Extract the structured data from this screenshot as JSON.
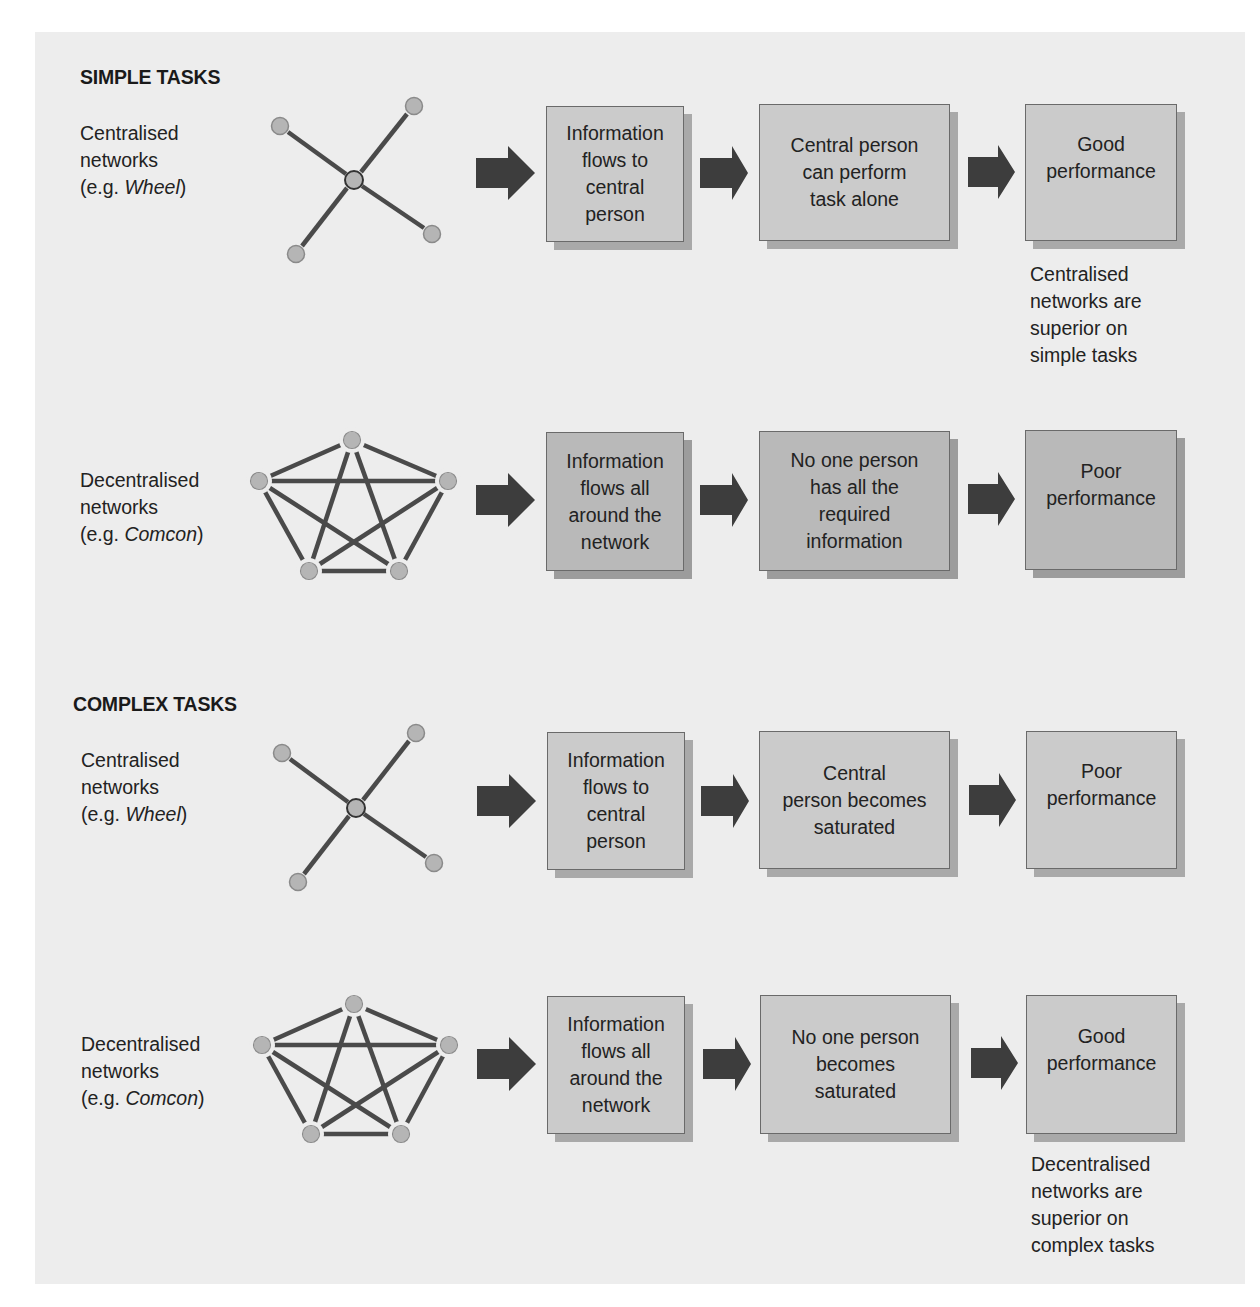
{
  "sections": [
    {
      "heading": "SIMPLE TASKS",
      "rows": [
        {
          "network_label": {
            "line1": "Centralised",
            "line2": "networks",
            "prefix": "(e.g. ",
            "example": "Wheel",
            "suffix": ")"
          },
          "network_type": "wheel",
          "steps": [
            "Information\nflows to\ncentral\nperson",
            "Central person\ncan perform\ntask alone",
            "Good\nperformance"
          ],
          "note": "Centralised\nnetworks are\nsuperior on\nsimple tasks"
        },
        {
          "network_label": {
            "line1": "Decentralised",
            "line2": "networks",
            "prefix": "(e.g. ",
            "example": "Comcon",
            "suffix": ")"
          },
          "network_type": "comcon",
          "steps": [
            "Information\nflows all\naround the\nnetwork",
            "No one person\nhas all the\nrequired\ninformation",
            "Poor\nperformance"
          ]
        }
      ]
    },
    {
      "heading": "COMPLEX TASKS",
      "rows": [
        {
          "network_label": {
            "line1": "Centralised",
            "line2": "networks",
            "prefix": "(e.g. ",
            "example": "Wheel",
            "suffix": ")"
          },
          "network_type": "wheel",
          "steps": [
            "Information\nflows to\ncentral\nperson",
            "Central\nperson becomes\nsaturated",
            "Poor\nperformance"
          ]
        },
        {
          "network_label": {
            "line1": "Decentralised",
            "line2": "networks",
            "prefix": "(e.g. ",
            "example": "Comcon",
            "suffix": ")"
          },
          "network_type": "comcon",
          "steps": [
            "Information\nflows all\naround the\nnetwork",
            "No one person\nbecomes\nsaturated",
            "Good\nperformance"
          ],
          "note": "Decentralised\nnetworks are\nsuperior on\ncomplex tasks"
        }
      ]
    }
  ],
  "colors": {
    "panel_bg": "#ededed",
    "box_fill": "#cbcbcb",
    "box_fill_dark": "#b9b9b9",
    "box_shadow": "#a9a9a9",
    "arrow": "#3d3d3d",
    "edge": "#4a4a4a",
    "node_fill": "#b5b5b5"
  }
}
